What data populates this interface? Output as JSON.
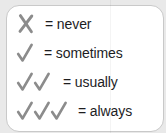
{
  "legend": {
    "title": "Frequency key",
    "rows": [
      {
        "mark_count": 0,
        "mark_type": "cross",
        "symbol": "X",
        "equals": "=",
        "label": "= never",
        "meaning": "never"
      },
      {
        "mark_count": 1,
        "mark_type": "check",
        "symbol": "✓",
        "equals": "=",
        "label": "= sometimes",
        "meaning": "sometimes"
      },
      {
        "mark_count": 2,
        "mark_type": "check",
        "symbol": "✓✓",
        "equals": "=",
        "label": "= usually",
        "meaning": "usually"
      },
      {
        "mark_count": 3,
        "mark_type": "check",
        "symbol": "✓✓✓",
        "equals": "=",
        "label": "= always",
        "meaning": "always"
      }
    ]
  },
  "colors": {
    "page_background": "#e9e9e9",
    "card_background": "#ffffff",
    "card_border": "#c9c9c9",
    "mark": "#8c8c8c",
    "text": "#1d1d1f"
  }
}
